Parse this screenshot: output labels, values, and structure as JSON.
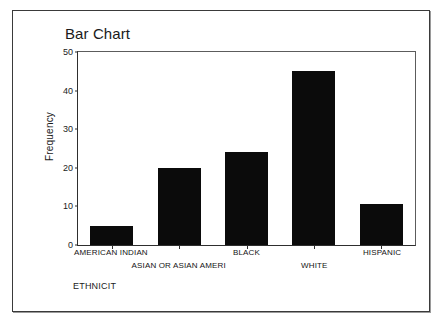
{
  "window": {
    "background_color": "#ffffff",
    "border_color": "#3a3a3a"
  },
  "chart_data": {
    "type": "bar",
    "title": "Bar Chart",
    "xlabel": "ETHNICIT",
    "ylabel": "Frequency",
    "categories": [
      "AMERICAN INDIAN",
      "ASIAN OR ASIAN AMERI",
      "BLACK",
      "WHITE",
      "HISPANIC"
    ],
    "values": [
      5,
      20,
      24,
      45,
      10.5
    ],
    "ylim": [
      0,
      50
    ],
    "ytick_labels": [
      "0",
      "10",
      "20",
      "30",
      "40",
      "50"
    ],
    "ytick_values": [
      0,
      10,
      20,
      30,
      40,
      50
    ],
    "grid": false,
    "legend": "none",
    "bar_color": "#0b0b0b",
    "label_rows": [
      0,
      1,
      0,
      1,
      0
    ]
  }
}
